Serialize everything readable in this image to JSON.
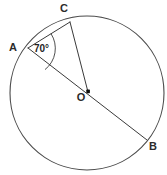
{
  "diagram": {
    "type": "geometry-circle",
    "canvas": {
      "width": 167,
      "height": 175,
      "background": "#ffffff"
    },
    "colors": {
      "stroke": "#3a3a3a",
      "circle_stroke": "#4a4a4a",
      "label_text": "#2b2b2b",
      "center_dot": "#111111"
    },
    "circle": {
      "cx": 87,
      "cy": 93,
      "r": 77
    },
    "center": {
      "label": "O",
      "x": 88,
      "y": 92,
      "label_x": 81,
      "label_y": 101
    },
    "points": [
      {
        "name": "A",
        "label": "A",
        "x": 28,
        "y": 48,
        "label_x": 13,
        "label_y": 51
      },
      {
        "name": "C",
        "label": "C",
        "x": 70,
        "y": 22,
        "label_x": 64,
        "label_y": 12
      },
      {
        "name": "B",
        "label": "B",
        "x": 147,
        "y": 140,
        "label_x": 150,
        "label_y": 150
      }
    ],
    "segments": [
      {
        "name": "chord-AC",
        "from": "A",
        "to": "C"
      },
      {
        "name": "diameter-AB",
        "from": "A",
        "to": "B"
      },
      {
        "name": "radius-OC",
        "from": "O",
        "to": "C"
      }
    ],
    "angle": {
      "label": "70°",
      "value": 70,
      "unit": "degrees",
      "vertex": "A",
      "between": [
        "AC",
        "AB"
      ],
      "label_x": 34,
      "label_y": 52
    }
  }
}
